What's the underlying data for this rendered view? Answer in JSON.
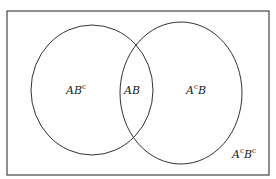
{
  "diagram": {
    "type": "venn",
    "sets": [
      "A",
      "B"
    ],
    "colors": {
      "stroke": "#333333",
      "background": "#ffffff"
    },
    "regions": [
      {
        "id": "a-only",
        "base": "AB",
        "sup": "c",
        "label": "AB^c"
      },
      {
        "id": "intersection",
        "label": "AB"
      },
      {
        "id": "b-only",
        "base": "A",
        "sup": "c",
        "rest": "B",
        "label": "A^cB"
      },
      {
        "id": "outside",
        "base": "A",
        "sup": "c",
        "rest": "B",
        "sup2": "c",
        "label": "A^cB^c"
      }
    ]
  }
}
